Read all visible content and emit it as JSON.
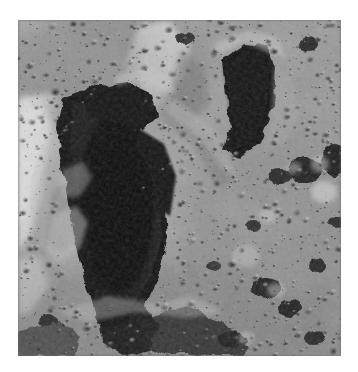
{
  "document": {
    "kind": "photograph",
    "subject": "lunar-surface",
    "title": "",
    "caption": "",
    "background_color": "#ffffff"
  },
  "photo": {
    "name": "lunar-crater-oblique-view",
    "description": "Black and white orbital photograph of a heavily cratered lunar surface. A large irregular crater filled with deep black shadow dominates the center-left; a smaller crescent-shadowed crater lies upper-right; the remaining terrain is dense regolith pocked with small impact craters.",
    "color_mode": "grayscale",
    "frame": {
      "x": 18,
      "y": 20,
      "width": 323,
      "height": 336
    },
    "tones": {
      "shadow_black": "#060606",
      "deep_shadow": "#101010",
      "dark_gray": "#3a3a3a",
      "mid_dark": "#5f5f5f",
      "mid_gray": "#868686",
      "light_gray": "#a8a8a8",
      "highlight": "#cfcfcf",
      "bright_white": "#e8e8e8",
      "page_white": "#ffffff"
    },
    "features": [
      {
        "name": "main-crater-shadow",
        "type": "shadowed-crater",
        "position": "center-left",
        "tone": "#070707"
      },
      {
        "name": "secondary-crater-shadow",
        "type": "crescent-shadow-crater",
        "position": "upper-right",
        "tone": "#0e0e0e"
      },
      {
        "name": "bright-rim-highlight",
        "type": "illuminated-rim",
        "position": "left-edge",
        "tone": "#dcdcdc"
      },
      {
        "name": "central-ridge",
        "type": "ridge",
        "position": "upper-center",
        "tone": "#b4b4b4"
      },
      {
        "name": "cratered-plain",
        "type": "regolith-terrain",
        "position": "right-and-bottom",
        "tone": "#909090"
      },
      {
        "name": "lower-shadow-band",
        "type": "shadow-band",
        "position": "bottom-center",
        "tone": "#1c1c1c"
      }
    ],
    "illumination": {
      "sun_direction": "from-right",
      "shadow_direction": "to-left"
    }
  }
}
